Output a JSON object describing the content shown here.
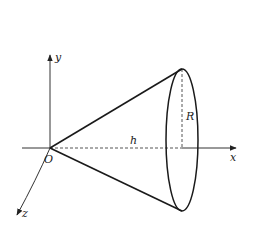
{
  "diagram": {
    "labels": {
      "origin": "O",
      "x_axis": "x",
      "y_axis": "y",
      "z_axis": "z",
      "height": "h",
      "radius": "R"
    },
    "colors": {
      "stroke": "#1a1a1a",
      "axis": "#333333",
      "dashed": "#555555",
      "background": "#ffffff"
    }
  }
}
